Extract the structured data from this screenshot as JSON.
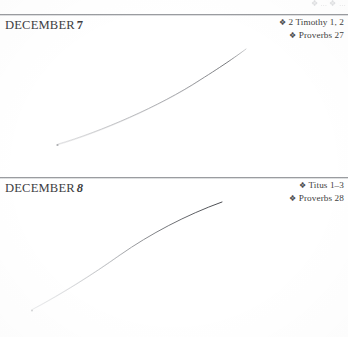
{
  "page": {
    "background_color": "#ffffff",
    "text_color": "#3a3a3a",
    "rule_color": "#9a9ca0",
    "ghost_text": "2 Timothy 1, 2"
  },
  "ghost": {
    "text": "❖ ... ❖ ..."
  },
  "entries": [
    {
      "month": "DECEMBER",
      "day": "7",
      "day_style": "bold",
      "readings": [
        {
          "bullet": "❖",
          "text": "2 Timothy 1, 2"
        },
        {
          "bullet": "❖",
          "text": "Proverbs 27"
        }
      ]
    },
    {
      "month": "DECEMBER",
      "day": "8",
      "day_style": "bold-italic",
      "readings": [
        {
          "bullet": "❖",
          "text": "Titus 1–3"
        },
        {
          "bullet": "❖",
          "text": "Proverbs 28"
        }
      ]
    }
  ]
}
